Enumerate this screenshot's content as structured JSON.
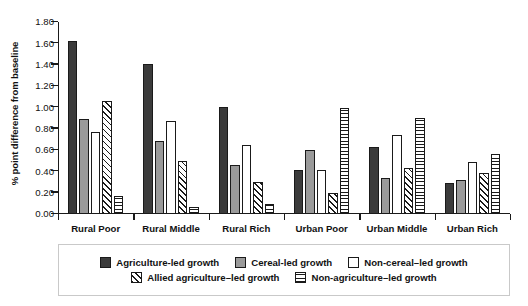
{
  "chart_data": {
    "type": "bar",
    "title": "",
    "subtitle": "",
    "xlabel": "",
    "ylabel": "% point difference from baseline",
    "ylim": [
      0.0,
      1.8
    ],
    "ytick_labels": [
      "0.00",
      "0.20",
      "0.40",
      "0.60",
      "0.80",
      "1.00",
      "1.20",
      "1.40",
      "1.60",
      "1.80"
    ],
    "ytick_values": [
      0.0,
      0.2,
      0.4,
      0.6,
      0.8,
      1.0,
      1.2,
      1.4,
      1.6,
      1.8
    ],
    "grid": false,
    "legend_position": "bottom",
    "categories": [
      "Rural Poor",
      "Rural Middle",
      "Rural Rich",
      "Urban Poor",
      "Urban Middle",
      "Urban Rich"
    ],
    "series": [
      {
        "name": "Agriculture-led growth",
        "fill": "solid-dark",
        "color": "#3b3b3b",
        "values": [
          1.62,
          1.41,
          1.0,
          0.41,
          0.63,
          0.29
        ]
      },
      {
        "name": "Cereal-led growth",
        "fill": "solid-gray",
        "color": "#9a9a9a",
        "values": [
          0.89,
          0.68,
          0.46,
          0.6,
          0.34,
          0.32
        ]
      },
      {
        "name": "Non-cereal–led growth",
        "fill": "solid-white",
        "color": "#ffffff",
        "values": [
          0.77,
          0.87,
          0.65,
          0.41,
          0.74,
          0.49
        ]
      },
      {
        "name": "Allied agriculture–led growth",
        "fill": "diagonal-hatch",
        "color": "#ffffff",
        "values": [
          1.06,
          0.5,
          0.3,
          0.2,
          0.43,
          0.38
        ]
      },
      {
        "name": "Non-agriculture–led growth",
        "fill": "horizontal-lines",
        "color": "#ffffff",
        "values": [
          0.17,
          0.07,
          0.09,
          0.99,
          0.9,
          0.56
        ]
      }
    ]
  },
  "legend": {
    "rows": [
      [
        "Agriculture-led growth",
        "Cereal-led growth",
        "Non-cereal–led growth"
      ],
      [
        "Allied agriculture–led growth",
        "Non-agriculture–led growth"
      ]
    ]
  }
}
